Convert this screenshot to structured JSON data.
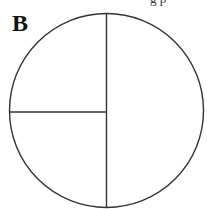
{
  "panel": {
    "label": "B",
    "top_fragment": "g p"
  },
  "diagram": {
    "shape": "circle",
    "center": [
      106.5,
      110.5
    ],
    "radius": 97,
    "stroke": "#333333",
    "lines": [
      {
        "name": "vertical-diameter",
        "x1": 106.5,
        "y1": 13.5,
        "x2": 106.5,
        "y2": 207.5
      },
      {
        "name": "horizontal-radius-left",
        "x1": 9.5,
        "y1": 112,
        "x2": 106.5,
        "y2": 112
      }
    ]
  }
}
